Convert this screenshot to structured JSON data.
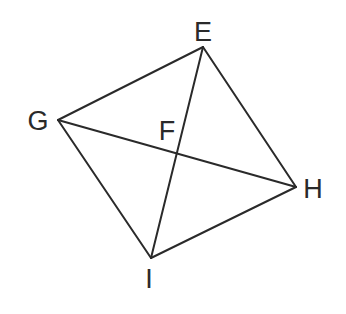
{
  "diagram": {
    "type": "quadrilateral-with-diagonals",
    "colors": {
      "line": "#2a2a2a",
      "label": "#2a2a2a",
      "background": "#ffffff"
    },
    "points": {
      "E": {
        "x": 203,
        "y": 47,
        "label": "E",
        "label_x": 203,
        "label_y": 32
      },
      "G": {
        "x": 58,
        "y": 120,
        "label": "G",
        "label_x": 38,
        "label_y": 121
      },
      "H": {
        "x": 296,
        "y": 187,
        "label": "H",
        "label_x": 313,
        "label_y": 189
      },
      "I": {
        "x": 151,
        "y": 258,
        "label": "I",
        "label_x": 149,
        "label_y": 279
      },
      "F": {
        "x": 177,
        "y": 153,
        "label": "F",
        "label_x": 167,
        "label_y": 131
      }
    },
    "segments": [
      {
        "name": "segment-GE",
        "from": "G",
        "to": "E"
      },
      {
        "name": "segment-EH",
        "from": "E",
        "to": "H"
      },
      {
        "name": "segment-HI",
        "from": "H",
        "to": "I"
      },
      {
        "name": "segment-IG",
        "from": "I",
        "to": "G"
      },
      {
        "name": "diagonal-EI",
        "from": "E",
        "to": "I"
      },
      {
        "name": "diagonal-GH",
        "from": "G",
        "to": "H"
      }
    ]
  }
}
